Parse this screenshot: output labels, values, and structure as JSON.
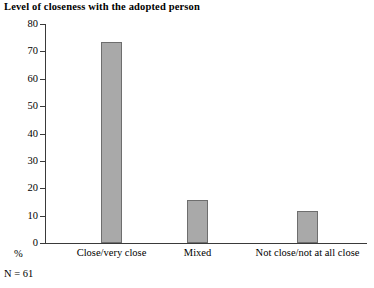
{
  "chart_data": {
    "type": "bar",
    "title": "Level of closeness with the adopted person",
    "xlabel": "",
    "ylabel": "%",
    "categories": [
      "Close/very close",
      "Mixed",
      "Not close/not at all close"
    ],
    "values": [
      73.4,
      15.7,
      11.7
    ],
    "ylim": [
      0,
      80
    ],
    "ytick_labels": [
      "80",
      "70",
      "60",
      "50",
      "40",
      "30",
      "20",
      "10",
      "0"
    ],
    "ytick_values": [
      80,
      70,
      60,
      50,
      40,
      30,
      20,
      10,
      0
    ],
    "grid": false,
    "legend": false,
    "bar_fill_color": "#a9a9a9",
    "bar_border_color": "#6e6e6e",
    "axis_color": "#3a3a3a",
    "background_color": "#ffffff",
    "annotations": [
      "N = 61"
    ]
  },
  "footnote": {
    "text": "N = 61"
  }
}
